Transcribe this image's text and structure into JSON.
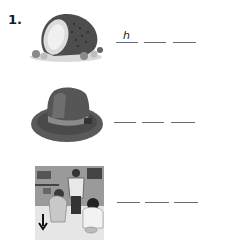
{
  "exercise": {
    "number": "1.",
    "items": [
      {
        "picture": "ham-icon",
        "blanks": [
          "h",
          "",
          ""
        ]
      },
      {
        "picture": "hat-icon",
        "blanks": [
          "",
          "",
          ""
        ]
      },
      {
        "picture": "classroom-photo",
        "blanks": [
          "",
          "",
          ""
        ]
      }
    ]
  }
}
